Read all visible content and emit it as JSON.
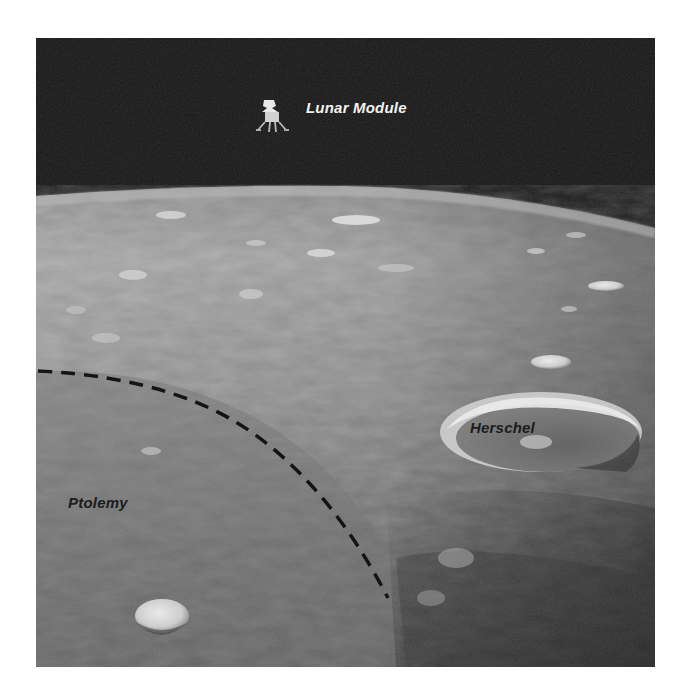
{
  "figure": {
    "labels": {
      "lunar_module": "Lunar Module",
      "herschel": "Herschel",
      "ptolemy": "Ptolemy"
    },
    "annotations": {
      "boundary_line_style": "dashed",
      "boundary_meaning": "rim of Ptolemy crater"
    },
    "colors": {
      "sky": "#141414",
      "surface_light": "#b4b4b4",
      "surface_dark": "#4a4a4a",
      "dashed_line": "#1a1a1a",
      "label_on_dark": "#f2f2f2",
      "label_on_light": "#1c1c1c"
    }
  }
}
